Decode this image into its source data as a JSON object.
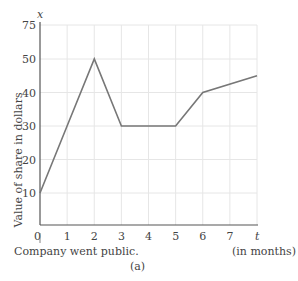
{
  "header_fragment": "(on high) (a)",
  "chart_data": {
    "type": "line",
    "title": "",
    "caption": "(a)",
    "xlabel": "t",
    "xlabel_note": "(in months)",
    "ylabel": "Value of share in dollars",
    "y_axis_letter": "x",
    "x": [
      0,
      1,
      2,
      3,
      4,
      5,
      6,
      8
    ],
    "values": [
      10,
      30,
      50,
      30,
      30,
      30,
      40,
      45
    ],
    "x_ticks": [
      "0",
      "1",
      "2",
      "3",
      "4",
      "5",
      "6",
      "7",
      "t"
    ],
    "y_ticks": [
      "10",
      "20",
      "30",
      "40",
      "50",
      "75"
    ],
    "xlim": [
      0,
      8
    ],
    "ylim": [
      0,
      75
    ],
    "grid": true,
    "annotation": "Company went public.",
    "line_color": "#777777",
    "grid_color": "#e6e6e6"
  },
  "labels": {
    "y_axis_letter": "x",
    "x_axis_letter": "t",
    "x_unit": "(in months)",
    "y_title": "Value of share in dollars",
    "annotation": "Company went public.",
    "caption": "(a)",
    "origin": "0"
  }
}
